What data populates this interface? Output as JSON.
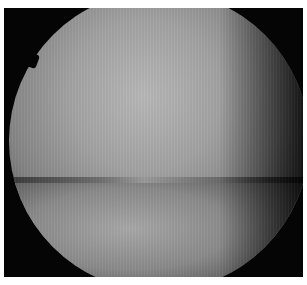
{
  "image": {
    "description": "Grayscale arthroscopic view of a joint showing two rounded cartilage surfaces inside a circular scope field on a black background",
    "colors": {
      "background": "#050505",
      "border": "#ffffff",
      "highlight": "#b8b8b8"
    }
  }
}
